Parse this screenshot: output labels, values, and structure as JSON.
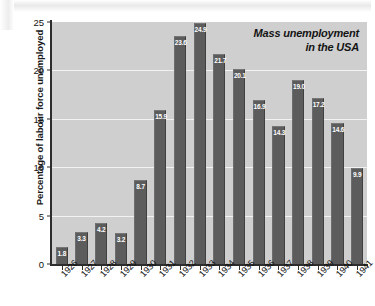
{
  "chart_data": {
    "type": "bar",
    "title": "Mass unemployment in the USA",
    "title_line1": "Mass unemployment",
    "title_line2": "in the USA",
    "xlabel": "",
    "ylabel": "Percentage of labour force unemployed",
    "ylim": [
      0,
      25
    ],
    "yticks": [
      0,
      5,
      10,
      15,
      20,
      25
    ],
    "ytick_labels": [
      "0",
      "5",
      "10",
      "15",
      "20",
      "25"
    ],
    "gridlines": [
      5,
      10,
      15,
      20
    ],
    "grid": true,
    "legend": null,
    "categories": [
      "1926",
      "1927",
      "1928",
      "1929",
      "1930",
      "1931",
      "1932",
      "1933",
      "1934",
      "1935",
      "1936",
      "1937",
      "1938",
      "1939",
      "1940",
      "1941"
    ],
    "values": [
      1.8,
      3.3,
      4.2,
      3.2,
      8.7,
      15.9,
      23.6,
      24.9,
      21.7,
      20.1,
      16.9,
      14.3,
      19.0,
      17.2,
      14.6,
      9.9
    ],
    "value_labels": [
      "1.8",
      "3.3",
      "4.2",
      "3.2",
      "8.7",
      "15.9",
      "23.6",
      "24.9",
      "21.7",
      "20.1",
      "16.9",
      "14.3",
      "19.0",
      "17.2",
      "14.6",
      "9.9"
    ],
    "colors": {
      "bar": "#5c5c5c",
      "plot_background": "#cfcfcf",
      "gridline": "#f2f2f2",
      "axis": "#2d2d2d",
      "value_label": "#ffffff",
      "text": "#111111",
      "page_background": "#ffffff"
    }
  }
}
